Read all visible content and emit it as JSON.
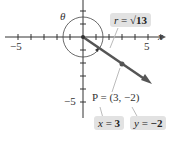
{
  "diagram": {
    "axis": {
      "x_label": "x",
      "x_neg_tick": "−5",
      "x_pos_tick": "5",
      "y_neg_tick": "−5"
    },
    "angle_label": "θ",
    "r_label": {
      "var": "r",
      "eq": " = ",
      "value": "√13"
    },
    "point_label": "P = (3, −2)",
    "x_box": {
      "var": "x",
      "eq": " = ",
      "value": "3"
    },
    "y_box": {
      "var": "y",
      "eq": " = ",
      "value": "−2"
    }
  },
  "colors": {
    "axis": "#333333",
    "vector": "#555555",
    "box": "#e2e2e2",
    "leader": "#bbbbbb"
  }
}
